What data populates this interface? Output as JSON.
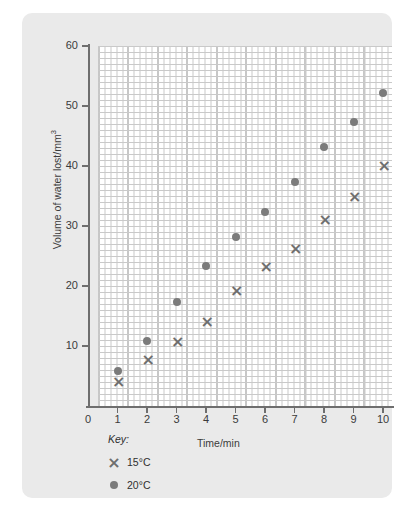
{
  "chart_data": {
    "type": "scatter",
    "title": "",
    "xlabel": "Time/min",
    "ylabel": "Volume of water lost/mm",
    "ylabel_sup": "3",
    "xlim": [
      0,
      10
    ],
    "ylim": [
      0,
      60
    ],
    "xticks": [
      "0",
      "1",
      "2",
      "3",
      "4",
      "5",
      "6",
      "7",
      "8",
      "9",
      "10"
    ],
    "yticks": [
      "10",
      "20",
      "30",
      "40",
      "50",
      "60"
    ],
    "grid": "graph-paper minor 1 unit, major 5 units",
    "legend_position": "below-axis-left",
    "x": [
      1,
      2,
      3,
      4,
      5,
      6,
      7,
      8,
      9,
      10
    ],
    "series": [
      {
        "name": "15°C",
        "marker": "cross",
        "color": "#6e6e6e",
        "values": [
          4.2,
          7.8,
          10.9,
          14.2,
          19.4,
          23.3,
          26.4,
          31.2,
          35.0,
          40.2
        ]
      },
      {
        "name": "20°C",
        "marker": "circle",
        "color": "#7b7b7b",
        "values": [
          5.8,
          10.9,
          17.3,
          23.3,
          28.2,
          32.4,
          37.3,
          43.2,
          47.4,
          52.1
        ]
      }
    ]
  },
  "key": {
    "title": "Key:",
    "entries": [
      {
        "label": "15°C",
        "marker": "cross-icon"
      },
      {
        "label": "20°C",
        "marker": "dot-icon"
      }
    ]
  },
  "colors": {
    "card_background": "#eaeaea",
    "plot_background": "#ffffff",
    "grid_minor": "#c9c9c9",
    "grid_major": "#8a8a8a",
    "axis": "#6e6e6e",
    "text": "#3b3b3b"
  }
}
